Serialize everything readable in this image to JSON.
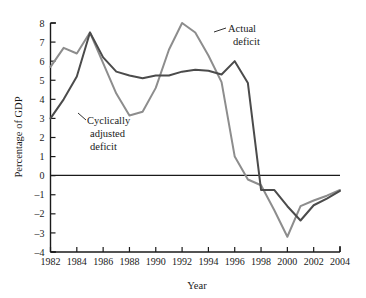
{
  "chart_data": {
    "type": "line",
    "title": "",
    "xlabel": "Year",
    "ylabel": "Percentage of GDP",
    "xlim": [
      1982,
      2004
    ],
    "ylim": [
      -4,
      8
    ],
    "grid": false,
    "legend_position": "inline-annotations",
    "x": [
      1982,
      1983,
      1984,
      1985,
      1986,
      1987,
      1988,
      1989,
      1990,
      1991,
      1992,
      1993,
      1994,
      1995,
      1996,
      1997,
      1998,
      1999,
      2000,
      2001,
      2002,
      2003,
      2004
    ],
    "x_tick_labels": [
      "1982",
      "1984",
      "1986",
      "1988",
      "1990",
      "1992",
      "1994",
      "1996",
      "1998",
      "2000",
      "2002",
      "2004"
    ],
    "y_tick_labels": [
      "8",
      "7",
      "6",
      "5",
      "4",
      "3",
      "2",
      "1",
      "0",
      "–1",
      "–2",
      "–3",
      "–4"
    ],
    "series": [
      {
        "name": "Actual deficit",
        "color": "#8d8d8d",
        "values": [
          5.7,
          6.7,
          6.4,
          7.5,
          5.9,
          4.3,
          3.15,
          3.35,
          4.6,
          6.6,
          8.0,
          7.5,
          6.3,
          4.9,
          1.0,
          -0.2,
          -0.5,
          -1.8,
          -3.2,
          -1.6,
          -1.3,
          -1.05,
          -0.75
        ]
      },
      {
        "name": "Cyclically adjusted deficit",
        "color": "#4b4b4b",
        "values": [
          3.0,
          4.0,
          5.2,
          7.5,
          6.2,
          5.45,
          5.25,
          5.1,
          5.25,
          5.25,
          5.45,
          5.55,
          5.5,
          5.3,
          6.0,
          4.85,
          -0.75,
          -0.75,
          -1.6,
          -2.35,
          -1.55,
          -1.2,
          -0.8
        ]
      }
    ],
    "annotations": [
      {
        "name": "actual-deficit-label",
        "lines": [
          "Actual",
          "deficit"
        ]
      },
      {
        "name": "cyclically-adjusted-label",
        "lines": [
          "Cyclically",
          "adjusted",
          "deficit"
        ]
      }
    ]
  }
}
